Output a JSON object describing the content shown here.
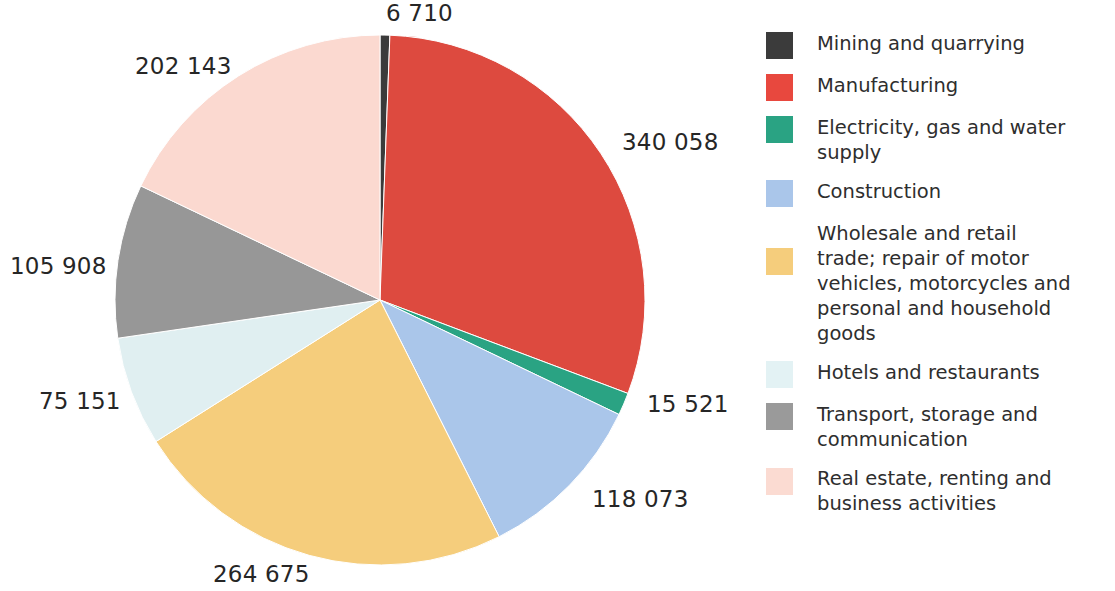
{
  "chart_data": {
    "type": "pie",
    "title": "",
    "subtitle": "",
    "xlabel": "",
    "ylabel": "",
    "legend_position": "right",
    "grid": false,
    "total": 1128239,
    "categories": [
      "Mining and quarrying",
      "Manufacturing",
      "Electricity, gas and water supply",
      "Construction",
      "Wholesale and retail trade; repair of motor vehicles, motorcycles and personal and household goods",
      "Hotels and restaurants",
      "Transport, storage and communication",
      "Real estate, renting and business activities"
    ],
    "values": [
      6710,
      340058,
      15521,
      118073,
      264675,
      75151,
      105908,
      202143
    ],
    "value_labels": [
      "6 710",
      "340 058",
      "15 521",
      "118 073",
      "264 675",
      "75 151",
      "105 908",
      "202 143"
    ],
    "colors": [
      "#3b3b3b",
      "#dd4a3f",
      "#2aa383",
      "#aac6ea",
      "#f5cd7c",
      "#e0eff1",
      "#979797",
      "#fbd9d0"
    ],
    "slices": [
      {
        "label": "Mining and quarrying",
        "value": 6710,
        "value_label": "6 710",
        "color": "#3b3b3b"
      },
      {
        "label": "Manufacturing",
        "value": 340058,
        "value_label": "340 058",
        "color": "#dd4a3f"
      },
      {
        "label": "Electricity, gas and water supply",
        "value": 15521,
        "value_label": "15 521",
        "color": "#2aa383"
      },
      {
        "label": "Construction",
        "value": 118073,
        "value_label": "118 073",
        "color": "#aac6ea"
      },
      {
        "label": "Wholesale and retail trade; repair of motor vehicles, motorcycles and personal and household goods",
        "value": 264675,
        "value_label": "264 675",
        "color": "#f5cd7c"
      },
      {
        "label": "Hotels and restaurants",
        "value": 75151,
        "value_label": "75 151",
        "color": "#e0eff1"
      },
      {
        "label": "Transport, storage and communication",
        "value": 105908,
        "value_label": "105 908",
        "color": "#979797"
      },
      {
        "label": "Real estate, renting and business activities",
        "value": 202143,
        "value_label": "202 143",
        "color": "#fbd9d0"
      }
    ]
  },
  "labels": {
    "mining": "6 710",
    "manufacturing": "340 058",
    "electricity": "15 521",
    "construction": "118 073",
    "wholesale": "264 675",
    "hotels": "75 151",
    "transport": "105 908",
    "realestate": "202 143"
  },
  "legend": {
    "items": [
      {
        "label": "Mining and quarrying",
        "color": "#3b3b3b",
        "swatch_name": "legend-swatch-mining"
      },
      {
        "label": "Manufacturing",
        "color": "#e8483e",
        "swatch_name": "legend-swatch-manufacturing"
      },
      {
        "label": "Electricity, gas and water supply",
        "color": "#2aa383",
        "swatch_name": "legend-swatch-electricity"
      },
      {
        "label": "Construction",
        "color": "#aac6ea",
        "swatch_name": "legend-swatch-construction"
      },
      {
        "label": "Wholesale and retail trade; repair of motor vehicles, motorcycles and personal and household goods",
        "color": "#f5cd7c",
        "swatch_name": "legend-swatch-wholesale"
      },
      {
        "label": "Hotels and restaurants",
        "color": "#e3f2f4",
        "swatch_name": "legend-swatch-hotels"
      },
      {
        "label": "Transport, storage and communication",
        "color": "#9a9a9a",
        "swatch_name": "legend-swatch-transport"
      },
      {
        "label": "Real estate, renting and business activities",
        "color": "#fbdbd2",
        "swatch_name": "legend-swatch-realestate"
      }
    ]
  }
}
